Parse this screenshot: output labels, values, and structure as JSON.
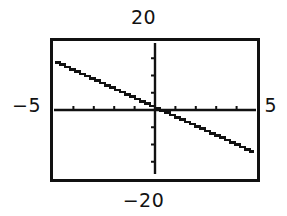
{
  "figure": {
    "kind": "graphing-calculator-plot",
    "background_color": "#ffffff",
    "ink_color": "#111111",
    "frame": {
      "border_color": "#111111",
      "border_width_px": 3,
      "fill_color": "#ffffff"
    }
  },
  "labels": {
    "y_max": "20",
    "y_min": "−20",
    "x_min": "−5",
    "x_max": "5"
  },
  "chart_data": {
    "type": "line",
    "title": "",
    "xlabel": "",
    "ylabel": "",
    "xlim": [
      -5,
      5
    ],
    "ylim": [
      -20,
      20
    ],
    "x_tick_step": 1,
    "y_tick_step": 5,
    "x_tick_values": [
      -5,
      -4,
      -3,
      -2,
      -1,
      0,
      1,
      2,
      3,
      4,
      5
    ],
    "y_tick_values": [
      -20,
      -15,
      -10,
      -5,
      0,
      5,
      10,
      15,
      20
    ],
    "grid": false,
    "legend": false,
    "axes_style": "centered-cross",
    "series": [
      {
        "name": "line",
        "rendering": "aliased-stairstep",
        "color": "#111111",
        "slope": -2.7,
        "intercept": 0.55,
        "x": [
          -5,
          -4,
          -3,
          -2,
          -1,
          0,
          1,
          2,
          3,
          4,
          4.9
        ],
        "values": [
          14.05,
          11.35,
          8.65,
          5.95,
          3.25,
          0.55,
          -2.15,
          -4.85,
          -7.55,
          -10.25,
          -12.68
        ],
        "x_axis_crossing": 0.2
      }
    ],
    "tick_labels_shown": [
      "20",
      "-20",
      "-5",
      "5"
    ]
  }
}
